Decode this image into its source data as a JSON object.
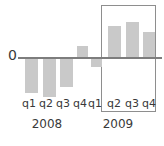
{
  "chart_data": {
    "type": "bar",
    "title": "",
    "subtitle": "",
    "xlabel": "",
    "ylabel": "",
    "categories": [
      "q1",
      "q2",
      "q3",
      "q4",
      "q1",
      "q2",
      "q3",
      "q4"
    ],
    "group_labels": [
      "2008",
      "2009"
    ],
    "groups": [
      {
        "label": "2008",
        "categories": [
          "q1",
          "q2",
          "q3",
          "q4"
        ]
      },
      {
        "label": "2009",
        "categories": [
          "q1",
          "q2",
          "q3",
          "q4"
        ]
      }
    ],
    "values": [
      -34,
      -38,
      -28,
      11,
      -8,
      31,
      35,
      25
    ],
    "points": [
      {
        "category": "q1",
        "group": "2008",
        "value": -34
      },
      {
        "category": "q2",
        "group": "2008",
        "value": -38
      },
      {
        "category": "q3",
        "group": "2008",
        "value": -28
      },
      {
        "category": "q4",
        "group": "2008",
        "value": 11
      },
      {
        "category": "q1",
        "group": "2009",
        "value": -8
      },
      {
        "category": "q2",
        "group": "2009",
        "value": 31
      },
      {
        "category": "q3",
        "group": "2009",
        "value": 35
      },
      {
        "category": "q4",
        "group": "2009",
        "value": 25
      }
    ],
    "ylim": [
      -40,
      40
    ],
    "yticks": [
      0
    ],
    "ytick_labels": [
      "0"
    ],
    "grid": false,
    "legend": false,
    "legend_position": "none",
    "bar_color": "#c9c9c9",
    "axis_color": "#7d7d7d",
    "annotations": [
      {
        "type": "highlight-rect",
        "label": "",
        "covers": [
          "2009 q2",
          "2009 q3",
          "2009 q4"
        ],
        "border_color": "#8e8e8e"
      }
    ]
  },
  "axis": {
    "zero_label": "0"
  },
  "quarters": [
    {
      "label": "q1",
      "left": 20
    },
    {
      "label": "q2",
      "left": 37
    },
    {
      "label": "q3",
      "left": 54
    },
    {
      "label": "q4",
      "left": 71
    },
    {
      "label": "q1",
      "left": 86
    },
    {
      "label": "q2",
      "left": 105
    },
    {
      "label": "q3",
      "left": 123
    },
    {
      "label": "q4",
      "left": 140
    }
  ],
  "years": [
    {
      "label": "2008",
      "left": 27
    },
    {
      "label": "2009",
      "left": 98
    }
  ],
  "bars": [
    {
      "name": "bar-2008-q1",
      "left": 25,
      "width": 13,
      "top": 59,
      "height": 34,
      "sign": "negative"
    },
    {
      "name": "bar-2008-q2",
      "left": 43,
      "width": 13,
      "top": 59,
      "height": 38,
      "sign": "negative"
    },
    {
      "name": "bar-2008-q3",
      "left": 60,
      "width": 13,
      "top": 59,
      "height": 28,
      "sign": "negative"
    },
    {
      "name": "bar-2008-q4",
      "left": 77,
      "width": 11,
      "top": 46,
      "height": 11,
      "sign": "positive"
    },
    {
      "name": "bar-2009-q1",
      "left": 91,
      "width": 11,
      "top": 59,
      "height": 8,
      "sign": "negative"
    },
    {
      "name": "bar-2009-q2",
      "left": 108,
      "width": 13,
      "top": 26,
      "height": 31,
      "sign": "positive"
    },
    {
      "name": "bar-2009-q3",
      "left": 126,
      "width": 13,
      "top": 22,
      "height": 35,
      "sign": "positive"
    },
    {
      "name": "bar-2009-q4",
      "left": 143,
      "width": 12,
      "top": 32,
      "height": 25,
      "sign": "positive"
    }
  ]
}
